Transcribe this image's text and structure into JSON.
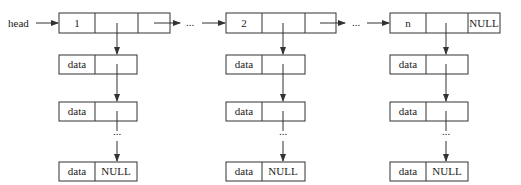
{
  "diagram": {
    "type": "linked-list-of-linked-lists",
    "head_label": "head",
    "ellipsis": "...",
    "main_nodes": [
      {
        "value": "1",
        "next": "",
        "x": 59
      },
      {
        "value": "2",
        "next": "",
        "x": 226
      },
      {
        "value": "n",
        "next": "NULL",
        "x": 390
      }
    ],
    "sub_nodes": [
      {
        "data": "data",
        "next": ""
      },
      {
        "data": "data",
        "next": ""
      },
      {
        "data": "data",
        "next": "NULL"
      }
    ],
    "colors": {
      "line": "#333333",
      "text": "#222222",
      "background": "#ffffff"
    }
  }
}
